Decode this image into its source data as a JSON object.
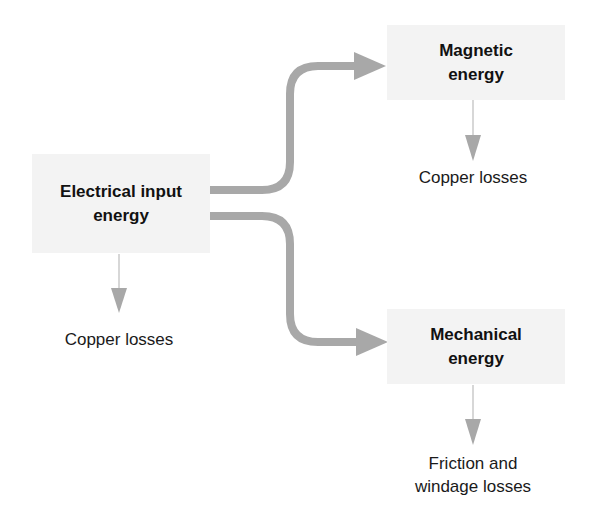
{
  "diagram": {
    "colors": {
      "box_fill": "#f3f3f3",
      "arrow": "#a8a8a8",
      "text": "#111111"
    },
    "nodes": {
      "electrical": {
        "line1": "Electrical input",
        "line2": "energy"
      },
      "magnetic": {
        "line1": "Magnetic",
        "line2": "energy"
      },
      "mechanical": {
        "line1": "Mechanical",
        "line2": "energy"
      }
    },
    "losses": {
      "electrical": {
        "line1": "Copper losses"
      },
      "magnetic": {
        "line1": "Copper losses"
      },
      "mechanical": {
        "line1": "Friction and",
        "line2": "windage losses"
      }
    },
    "edges": [
      {
        "from": "Electrical input energy",
        "to": "Magnetic energy"
      },
      {
        "from": "Electrical input energy",
        "to": "Mechanical energy"
      },
      {
        "from": "Electrical input energy",
        "to": "Copper losses"
      },
      {
        "from": "Magnetic energy",
        "to": "Copper losses"
      },
      {
        "from": "Mechanical energy",
        "to": "Friction and windage losses"
      }
    ]
  }
}
